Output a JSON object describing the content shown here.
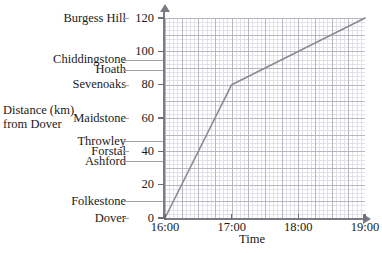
{
  "chart_data": {
    "type": "line",
    "title": "",
    "xlabel": "Time",
    "ylabel": "Distance (km) from Dover",
    "ylabel_line1": "Distance (km)",
    "ylabel_line2": "from Dover",
    "xlim": [
      16.0,
      19.0
    ],
    "ylim": [
      0,
      120
    ],
    "grid": true,
    "legend": "none",
    "x_tick_labels": [
      "16:00",
      "17:00",
      "18:00",
      "19:00"
    ],
    "x_tick_values": [
      16.0,
      17.0,
      18.0,
      19.0
    ],
    "y_tick_labels": [
      "0",
      "20",
      "40",
      "60",
      "80",
      "100",
      "120"
    ],
    "y_tick_values": [
      0,
      20,
      40,
      60,
      80,
      100,
      120
    ],
    "series": [
      {
        "name": "train journey",
        "color": "#8a8a92",
        "x": [
          16.0,
          17.0,
          19.0
        ],
        "y": [
          0,
          80,
          120
        ],
        "points": [
          {
            "time": "16:00",
            "distance_km": 0
          },
          {
            "time": "17:00",
            "distance_km": 80
          },
          {
            "time": "19:00",
            "distance_km": 120
          }
        ]
      }
    ],
    "station_labels": [
      {
        "name": "Burgess Hill",
        "distance_km": 120
      },
      {
        "name": "Chiddingstone",
        "distance_km": 95
      },
      {
        "name": "Hoath",
        "distance_km": 89
      },
      {
        "name": "Sevenoaks",
        "distance_km": 80
      },
      {
        "name": "Maidstone",
        "distance_km": 60
      },
      {
        "name": "Throwley",
        "distance_km": 46
      },
      {
        "name": "Forstal",
        "distance_km": 40
      },
      {
        "name": "Ashford",
        "distance_km": 34
      },
      {
        "name": "Folkestone",
        "distance_km": 10
      },
      {
        "name": "Dover",
        "distance_km": 0
      }
    ]
  }
}
